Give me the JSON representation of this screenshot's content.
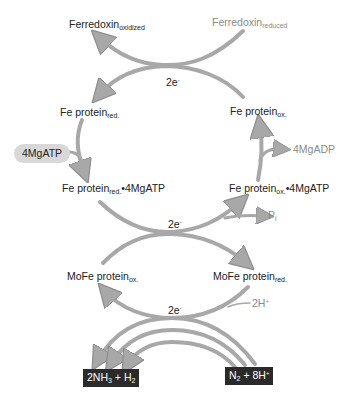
{
  "ferredoxin": {
    "oxidized": {
      "base": "Ferredoxin",
      "sub": "oxidized"
    },
    "reduced": {
      "base": "Ferredoxin",
      "sub": "reduced"
    }
  },
  "electrons": {
    "label": "2e",
    "sup": "-"
  },
  "fe_protein": {
    "red": {
      "base": "Fe protein",
      "sub": "red."
    },
    "ox": {
      "base": "Fe protein",
      "sub": "ox."
    },
    "red_atp": {
      "base": "Fe protein",
      "sub": "red.",
      "suffix": "•4MgATP"
    },
    "ox_atp": {
      "base": "Fe protein",
      "sub": "ox.",
      "suffix": "•4MgATP"
    }
  },
  "mgatp": "4MgATP",
  "mgadp": "4MgADP",
  "pi": {
    "base": "P",
    "sub": "i"
  },
  "mofe_protein": {
    "ox": {
      "base": "MoFe protein",
      "sub": "ox."
    },
    "red": {
      "base": "MoFe protein",
      "sub": "red."
    }
  },
  "protons": {
    "base": "2H",
    "sup": "+"
  },
  "products": {
    "p1": "2NH",
    "p1_sub": "3",
    "p2": " + H",
    "p2_sub": "2"
  },
  "reactants": {
    "r1": "N",
    "r1_sub": "2",
    "r2": " + 8H",
    "r2_sup": "+"
  },
  "colors": {
    "arrow": "#a8a8a8",
    "arrow_stroke": "#8c8c8c",
    "grey_text": "#8a8a8a",
    "box": "#2a2a2a",
    "pill": "#d8d8d8"
  }
}
